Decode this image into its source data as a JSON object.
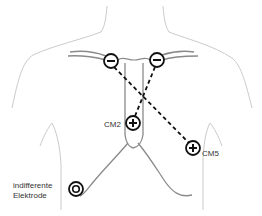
{
  "diagram": {
    "labels": {
      "cm2": "CM2",
      "cm5": "CM5",
      "indifferent_line1": "indifferente",
      "indifferent_line2": "Elektrode"
    },
    "electrodes": [
      {
        "id": "left-negative",
        "polarity": "-",
        "cx": 111,
        "cy": 61
      },
      {
        "id": "right-negative",
        "polarity": "-",
        "cx": 157,
        "cy": 60
      },
      {
        "id": "cm2-positive",
        "polarity": "+",
        "cx": 133,
        "cy": 123
      },
      {
        "id": "cm5-positive",
        "polarity": "+",
        "cx": 193,
        "cy": 148
      },
      {
        "id": "indifferent",
        "polarity": "ground",
        "cx": 76,
        "cy": 189
      }
    ],
    "leads": [
      {
        "from": "left-negative",
        "to": "cm5-positive",
        "style": "dashed"
      },
      {
        "from": "right-negative",
        "to": "cm2-positive",
        "style": "dashed"
      }
    ],
    "colors": {
      "outline": "#bdbdbd",
      "bone": "#8a8a8a",
      "electrode": "#111111",
      "lead": "#111111"
    }
  }
}
